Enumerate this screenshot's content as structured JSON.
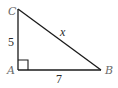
{
  "diagram": {
    "type": "right-triangle",
    "vertices": {
      "C": {
        "label": "C",
        "x": 18,
        "y": 9
      },
      "A": {
        "label": "A",
        "x": 18,
        "y": 70
      },
      "B": {
        "label": "B",
        "x": 101,
        "y": 70
      }
    },
    "sides": {
      "CA": {
        "label": "5"
      },
      "AB": {
        "label": "7"
      },
      "CB": {
        "label": "x"
      }
    },
    "right_angle_at": "A",
    "colors": {
      "line": "#1a1a1a",
      "vertex_label": "#6a6a6a",
      "side_label": "#2a2a2a"
    }
  }
}
